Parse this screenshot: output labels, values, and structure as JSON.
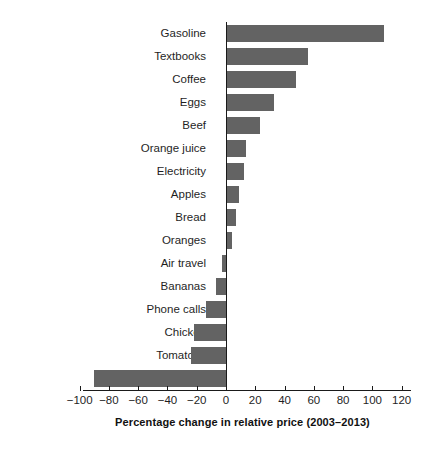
{
  "chart_data": {
    "type": "bar",
    "orientation": "horizontal",
    "title": "",
    "xlabel": "Percentage change in relative price (2003–2013)",
    "ylabel": "",
    "xlim": [
      -100,
      120
    ],
    "xticks": [
      -100,
      -80,
      -60,
      -40,
      -20,
      0,
      20,
      40,
      60,
      80,
      100,
      120
    ],
    "xtick_labels": [
      "−100",
      "−80",
      "−60",
      "−40",
      "−20",
      "0",
      "20",
      "40",
      "60",
      "80",
      "100",
      "120"
    ],
    "grid": false,
    "legend": null,
    "bar_color": "#636363",
    "categories": [
      "Gasoline",
      "Textbooks",
      "Coffee",
      "Eggs",
      "Beef",
      "Orange juice",
      "Electricity",
      "Apples",
      "Bread",
      "Oranges",
      "Air travel",
      "Bananas",
      "Phone calls",
      "Chicken",
      "Tomatoes",
      "Computers"
    ],
    "values": [
      108,
      56,
      48,
      33,
      23,
      14,
      12,
      9,
      7,
      4,
      -3,
      -7,
      -14,
      -22,
      -24,
      -90
    ]
  }
}
